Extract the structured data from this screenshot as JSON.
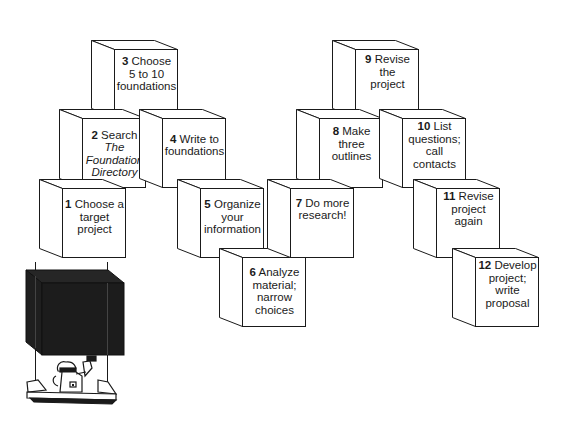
{
  "diagram": {
    "type": "staircase-of-blocks",
    "colors": {
      "line": "#1a1a1a",
      "fill": "#ffffff",
      "dark_block": "#1c1c1c"
    },
    "steps": [
      {
        "num": "1",
        "lines": [
          "Choose a",
          "target",
          "project"
        ],
        "x": 39,
        "y": 179
      },
      {
        "num": "2",
        "lines": [
          "Search"
        ],
        "italic_lines": [
          "The",
          "Foundation",
          "Directory"
        ],
        "x": 59,
        "y": 109
      },
      {
        "num": "3",
        "lines": [
          "Choose",
          "5 to 10",
          "foundations"
        ],
        "x": 91,
        "y": 40
      },
      {
        "num": "4",
        "lines": [
          "Write to",
          "foundations"
        ],
        "x": 139,
        "y": 109
      },
      {
        "num": "5",
        "lines": [
          "Organize",
          "your",
          "information"
        ],
        "x": 177,
        "y": 179
      },
      {
        "num": "6",
        "lines": [
          "Analyze",
          "material;",
          "narrow",
          "choices"
        ],
        "x": 219,
        "y": 248
      },
      {
        "num": "7",
        "lines": [
          "Do more",
          "research!"
        ],
        "x": 267,
        "y": 179
      },
      {
        "num": "8",
        "lines": [
          "Make three",
          "outlines"
        ],
        "x": 296,
        "y": 109
      },
      {
        "num": "9",
        "lines": [
          "Revise the",
          "project"
        ],
        "x": 332,
        "y": 40
      },
      {
        "num": "10",
        "lines": [
          "List",
          "questions;",
          "call contacts"
        ],
        "x": 379,
        "y": 109
      },
      {
        "num": "11",
        "lines": [
          "Revise",
          "project again"
        ],
        "x": 413,
        "y": 179
      },
      {
        "num": "12",
        "lines": [
          "Develop",
          "project; write",
          "proposal"
        ],
        "x": 452,
        "y": 248
      }
    ],
    "labels": {
      "s1": {
        "num": "1",
        "text": "Choose a target project"
      },
      "s2": {
        "num": "2",
        "text": "Search",
        "italic": "The Foundation Directory"
      },
      "s3": {
        "num": "3",
        "text": "Choose 5 to 10 foundations"
      },
      "s4": {
        "num": "4",
        "text": "Write to foundations"
      },
      "s5": {
        "num": "5",
        "text": "Organize your information"
      },
      "s6": {
        "num": "6",
        "text": "Analyze material; narrow choices"
      },
      "s7": {
        "num": "7",
        "text": "Do more research!"
      },
      "s8": {
        "num": "8",
        "text": "Make three outlines"
      },
      "s9": {
        "num": "9",
        "text": "Revise the project"
      },
      "s10": {
        "num": "10",
        "text": "List questions; call contacts"
      },
      "s11": {
        "num": "11",
        "text": "Revise project again"
      },
      "s12": {
        "num": "12",
        "text": "Develop project; write proposal"
      }
    },
    "illustration": "worker-lifting-dark-block"
  }
}
